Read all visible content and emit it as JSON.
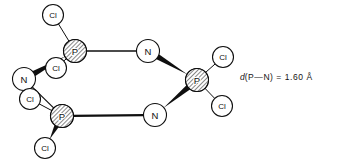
{
  "figure": {
    "background_color": "#ffffff",
    "line_color": "#0f0f0f",
    "atom_fill": "#ffffff",
    "phosphorus_hatch_color": "#1a1a1a"
  },
  "annotation": {
    "symbol": "d",
    "body": "(P—N) = 1.60 Å",
    "full_text": "d(P—N) = 1.60 Å",
    "bond": "P—N",
    "distance_value": "1.60",
    "distance_unit": "Å"
  },
  "atoms": [
    {
      "id": "cl-top-left",
      "element": "Cl",
      "label": "Cl",
      "x": 53,
      "y": 15,
      "r": 10.5,
      "style": "plain"
    },
    {
      "id": "p-upper-left",
      "element": "P",
      "label": "P",
      "x": 75,
      "y": 51,
      "r": 11.5,
      "style": "hatched"
    },
    {
      "id": "cl-inner-upper",
      "element": "Cl",
      "label": "Cl",
      "x": 56,
      "y": 68,
      "r": 10.5,
      "style": "plain"
    },
    {
      "id": "n-left",
      "element": "N",
      "label": "N",
      "x": 24,
      "y": 79,
      "r": 11.5,
      "style": "plain"
    },
    {
      "id": "cl-inner-lower",
      "element": "Cl",
      "label": "Cl",
      "x": 30,
      "y": 99,
      "r": 10.5,
      "style": "plain"
    },
    {
      "id": "p-lower-left",
      "element": "P",
      "label": "P",
      "x": 62,
      "y": 116,
      "r": 11.5,
      "style": "hatched"
    },
    {
      "id": "cl-bottom-left",
      "element": "Cl",
      "label": "Cl",
      "x": 45,
      "y": 148,
      "r": 10.5,
      "style": "plain"
    },
    {
      "id": "n-top",
      "element": "N",
      "label": "N",
      "x": 148,
      "y": 51,
      "r": 11.5,
      "style": "plain"
    },
    {
      "id": "n-bottom",
      "element": "N",
      "label": "N",
      "x": 155,
      "y": 115,
      "r": 11.5,
      "style": "plain"
    },
    {
      "id": "p-right",
      "element": "P",
      "label": "P",
      "x": 197,
      "y": 80,
      "r": 11.5,
      "style": "hatched"
    },
    {
      "id": "cl-top-right",
      "element": "Cl",
      "label": "Cl",
      "x": 223,
      "y": 57,
      "r": 10.5,
      "style": "plain"
    },
    {
      "id": "cl-bottom-right",
      "element": "Cl",
      "label": "Cl",
      "x": 222,
      "y": 106,
      "r": 10.5,
      "style": "plain"
    }
  ],
  "bonds": [
    {
      "id": "bond-p-upper-left--n-top",
      "from": "p-upper-left",
      "to": "n-top",
      "kind": "line",
      "width": 1.4
    },
    {
      "id": "bond-n-top--p-right",
      "from": "n-top",
      "to": "p-right",
      "kind": "wedge",
      "width": 1.4
    },
    {
      "id": "bond-p-right--n-bottom",
      "from": "p-right",
      "to": "n-bottom",
      "kind": "wedge",
      "width": 1.4
    },
    {
      "id": "bond-n-bottom--p-lower-left",
      "from": "n-bottom",
      "to": "p-lower-left",
      "kind": "line",
      "width": 2.2
    },
    {
      "id": "bond-p-lower-left--n-left",
      "from": "p-lower-left",
      "to": "n-left",
      "kind": "line",
      "width": 1.2
    },
    {
      "id": "bond-n-left--p-upper-left",
      "from": "n-left",
      "to": "p-upper-left",
      "kind": "wedge",
      "width": 1.4
    },
    {
      "id": "bond-p-upper-left--cl-top-left",
      "from": "p-upper-left",
      "to": "cl-top-left",
      "kind": "line",
      "width": 1.0
    },
    {
      "id": "bond-p-upper-left--cl-inner-upper",
      "from": "p-upper-left",
      "to": "cl-inner-upper",
      "kind": "line",
      "width": 1.0
    },
    {
      "id": "bond-p-lower-left--cl-inner-lower",
      "from": "p-lower-left",
      "to": "cl-inner-lower",
      "kind": "line",
      "width": 1.0
    },
    {
      "id": "bond-p-lower-left--cl-bottom-left",
      "from": "p-lower-left",
      "to": "cl-bottom-left",
      "kind": "wedge",
      "width": 1.2
    },
    {
      "id": "bond-p-right--cl-top-right",
      "from": "p-right",
      "to": "cl-top-right",
      "kind": "line",
      "width": 1.0
    },
    {
      "id": "bond-p-right--cl-bottom-right",
      "from": "p-right",
      "to": "cl-bottom-right",
      "kind": "line",
      "width": 1.0
    }
  ]
}
